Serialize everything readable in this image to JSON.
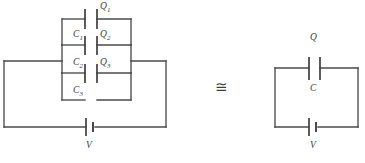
{
  "figure": {
    "background_color": "#ffffff",
    "wire_color": "#4a4a4a",
    "label_color": "#3c3c3c"
  },
  "equivalence": {
    "symbol": "≅",
    "name": "congruent-to"
  },
  "left_circuit": {
    "name": "series-capacitor-network",
    "capacitors": [
      {
        "charge_label": "Q",
        "charge_sub": "1",
        "cap_label": "C",
        "cap_sub": "1"
      },
      {
        "charge_label": "Q",
        "charge_sub": "2",
        "cap_label": "C",
        "cap_sub": "2"
      },
      {
        "charge_label": "Q",
        "charge_sub": "3",
        "cap_label": "C",
        "cap_sub": "3"
      }
    ],
    "source": {
      "label": "V",
      "name": "battery"
    }
  },
  "right_circuit": {
    "name": "equivalent-capacitor-circuit",
    "capacitor": {
      "charge_label": "Q",
      "cap_label": "C"
    },
    "source": {
      "label": "V",
      "name": "battery"
    }
  }
}
